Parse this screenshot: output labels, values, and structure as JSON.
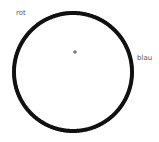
{
  "diagram": {
    "labels": {
      "top_left": "rot",
      "right": "blau"
    },
    "circle": {
      "cx": 73,
      "cy": 72,
      "r": 59,
      "stroke_width": 4,
      "stroke_color": "#111111",
      "fill": "#ffffff"
    },
    "marker": {
      "symbol": "+",
      "x": 75,
      "y": 52,
      "color": "#555555"
    }
  }
}
